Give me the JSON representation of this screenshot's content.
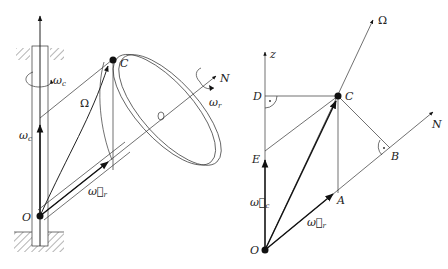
{
  "left_figure": {
    "labels": {
      "C": "C",
      "O": "O",
      "N": "N",
      "Omega": "Ω",
      "omega_c_top": "ω",
      "omega_c_top_sub": "c",
      "omega_c_side": "ω",
      "omega_c_side_sub": "c",
      "omega_r_disk": "ω",
      "omega_r_disk_sub": "r",
      "omega_r_vec": "ω⃗",
      "omega_r_vec_sub": "r"
    }
  },
  "right_figure": {
    "labels": {
      "z": "z",
      "D": "D",
      "C": "C",
      "Omega": "Ω",
      "N": "N",
      "B": "B",
      "E": "E",
      "A": "A",
      "O": "O",
      "omega_c_vec": "ω⃗",
      "omega_c_vec_sub": "c",
      "omega_r_vec": "ω⃗",
      "omega_r_vec_sub": "r"
    }
  },
  "colors": {
    "ink": "#222222",
    "background": "#ffffff"
  }
}
